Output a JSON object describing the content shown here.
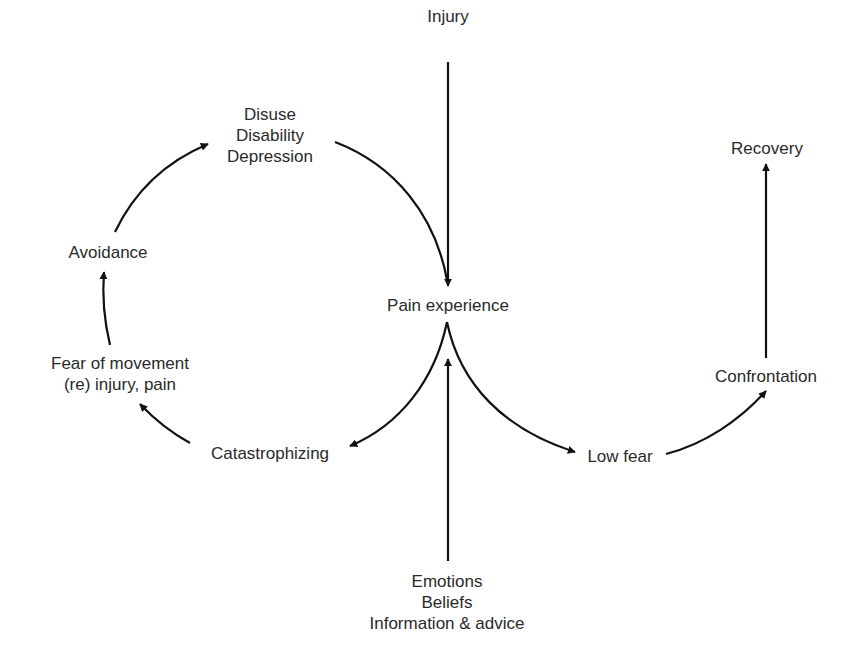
{
  "diagram": {
    "type": "fear-avoidance-model",
    "colors": {
      "background": "#ffffff",
      "stroke": "#111111",
      "text": "#2a2a2a"
    },
    "nodes": {
      "injury": {
        "lines": [
          "Injury"
        ]
      },
      "disuse": {
        "lines": [
          "Disuse",
          "Disability",
          "Depression"
        ]
      },
      "pain": {
        "lines": [
          "Pain experience"
        ]
      },
      "avoidance": {
        "lines": [
          "Avoidance"
        ]
      },
      "fear": {
        "lines": [
          "Fear of movement",
          "(re) injury, pain"
        ]
      },
      "catastrophizing": {
        "lines": [
          "Catastrophizing"
        ]
      },
      "low_fear": {
        "lines": [
          "Low fear"
        ]
      },
      "confrontation": {
        "lines": [
          "Confrontation"
        ]
      },
      "recovery": {
        "lines": [
          "Recovery"
        ]
      },
      "factors": {
        "lines": [
          "Emotions",
          "Beliefs",
          "Information & advice"
        ]
      }
    },
    "edges": [
      {
        "from": "Injury",
        "to": "Pain experience"
      },
      {
        "from": "Disuse / Disability / Depression",
        "to": "Pain experience"
      },
      {
        "from": "Pain experience",
        "to": "Catastrophizing"
      },
      {
        "from": "Catastrophizing",
        "to": "Fear of movement (re) injury, pain"
      },
      {
        "from": "Fear of movement (re) injury, pain",
        "to": "Avoidance"
      },
      {
        "from": "Avoidance",
        "to": "Disuse / Disability / Depression"
      },
      {
        "from": "Emotions / Beliefs / Information & advice",
        "to": "Pain experience"
      },
      {
        "from": "Pain experience",
        "to": "Low fear"
      },
      {
        "from": "Low fear",
        "to": "Confrontation"
      },
      {
        "from": "Confrontation",
        "to": "Recovery"
      }
    ]
  }
}
